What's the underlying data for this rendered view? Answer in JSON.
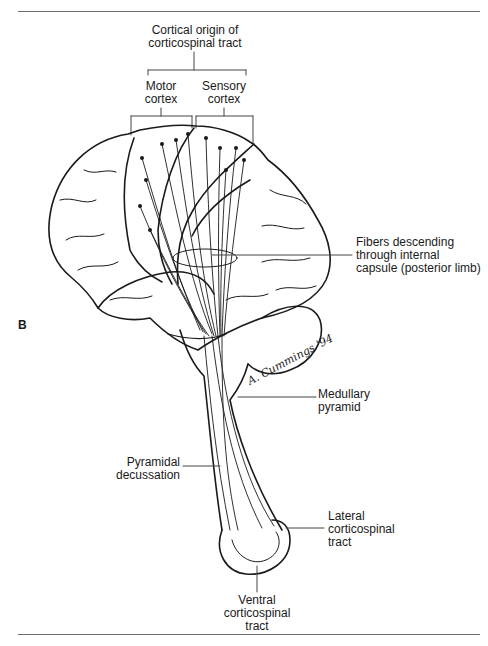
{
  "figure": {
    "panel_letter": "B",
    "header_label": {
      "line1": "Cortical origin of",
      "line2": "corticospinal tract"
    },
    "bracket_labels": [
      {
        "line1": "Motor",
        "line2": "cortex"
      },
      {
        "line1": "Sensory",
        "line2": "cortex"
      }
    ],
    "callouts": {
      "internal_capsule": {
        "line1": "Fibers descending",
        "line2": "through internal",
        "line3": "capsule (posterior limb)"
      },
      "medullary_pyramid": {
        "line1": "Medullary",
        "line2": "pyramid"
      },
      "pyramidal_decussation": {
        "line1": "Pyramidal",
        "line2": "decussation"
      },
      "lateral_tract": {
        "line1": "Lateral",
        "line2": "corticospinal",
        "line3": "tract"
      },
      "ventral_tract": {
        "line1": "Ventral",
        "line2": "corticospinal",
        "line3": "tract"
      }
    },
    "signature": "A. Cummings '94",
    "colors": {
      "ink": "#1a1a1a",
      "rule": "#6e6e6e",
      "background": "#ffffff"
    }
  }
}
